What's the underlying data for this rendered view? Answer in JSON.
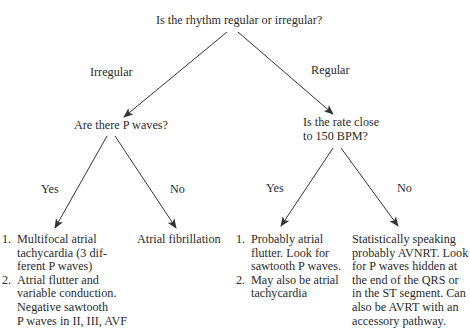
{
  "diagram": {
    "type": "decision-tree",
    "root": {
      "question": "Is the rhythm regular or irregular?"
    },
    "branches": {
      "irregular": {
        "edge_label": "Irregular",
        "question": "Are there P waves?",
        "yes": {
          "edge_label": "Yes",
          "items": [
            {
              "num": "1.",
              "lines": [
                "Multifocal atrial",
                "tachycardia (3 dif-",
                "ferent P waves)"
              ]
            },
            {
              "num": "2.",
              "lines": [
                "Atrial flutter and",
                "variable conduction.",
                "Negative sawtooth",
                "P waves in II, III, AVF"
              ]
            }
          ]
        },
        "no": {
          "edge_label": "No",
          "result": "Atrial fibrillation"
        }
      },
      "regular": {
        "edge_label": "Regular",
        "question_lines": [
          "Is the rate close",
          "to 150 BPM?"
        ],
        "yes": {
          "edge_label": "Yes",
          "items": [
            {
              "num": "1.",
              "lines": [
                "Probably atrial",
                "flutter. Look for",
                "sawtooth P waves."
              ]
            },
            {
              "num": "2.",
              "lines": [
                "May also be atrial",
                "tachycardia"
              ]
            }
          ]
        },
        "no": {
          "edge_label": "No",
          "result_lines": [
            "Statistically speaking",
            "probably AVNRT. Look",
            "for P waves hidden at",
            "the end of the QRS or",
            "in the ST segment. Can",
            "also be AVRT with an",
            "accessory pathway."
          ]
        }
      }
    },
    "colors": {
      "text": "#2b2b2b",
      "arrow": "#333333",
      "background": "#ffffff"
    }
  }
}
